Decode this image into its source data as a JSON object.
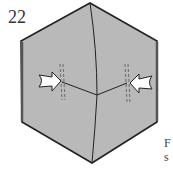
{
  "step": {
    "number": "22"
  },
  "colors": {
    "paper": "#b9b9b9",
    "outline": "#222222",
    "arrow_fill": "#ffffff",
    "dashed": "#555555"
  },
  "arrows": [
    {
      "name": "push-arrow-left",
      "direction": "right"
    },
    {
      "name": "push-arrow-right",
      "direction": "left"
    }
  ],
  "cropped_text": [
    "F",
    "s"
  ]
}
